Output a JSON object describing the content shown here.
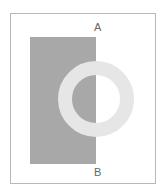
{
  "figure": {
    "labels": {
      "top": "A",
      "bottom": "B"
    },
    "colors": {
      "background": "#ffffff",
      "rectangle": "#a8a8a8",
      "ring": "#e6e6e6",
      "border": "#b8b8b8",
      "label": "#666666"
    }
  }
}
